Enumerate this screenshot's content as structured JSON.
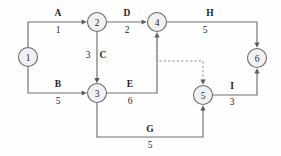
{
  "diagram": {
    "type": "directed-network-graph",
    "canvas": {
      "width": 281,
      "height": 156
    },
    "colors": {
      "node_fill": "#f1f1f1",
      "node_stroke": "#6a6a6a",
      "edge_stroke": "#6f6f6f",
      "dashed_stroke": "#8d8d8d",
      "text": "#1e1e1e",
      "background": "#fefefe"
    },
    "nodes": [
      {
        "id": "1",
        "label": "1",
        "cx": 28,
        "cy": 57,
        "r": 9.5
      },
      {
        "id": "2",
        "label": "2",
        "cx": 97,
        "cy": 22,
        "r": 9.5
      },
      {
        "id": "3",
        "label": "3",
        "cx": 97,
        "cy": 93,
        "r": 9.5
      },
      {
        "id": "4",
        "label": "4",
        "cx": 157,
        "cy": 22,
        "r": 9.5
      },
      {
        "id": "5",
        "label": "5",
        "cx": 203,
        "cy": 95,
        "r": 9.5
      },
      {
        "id": "6",
        "label": "6",
        "cx": 257,
        "cy": 58,
        "r": 9.5
      }
    ],
    "edges": [
      {
        "id": "A",
        "name": "A",
        "weight": "1",
        "from": "1",
        "to": "2",
        "name_x": 58,
        "name_y": 13,
        "weight_x": 58,
        "weight_y": 30,
        "style": "solid"
      },
      {
        "id": "B",
        "name": "B",
        "weight": "5",
        "from": "1",
        "to": "3",
        "name_x": 58,
        "name_y": 84,
        "weight_x": 58,
        "weight_y": 101,
        "style": "solid"
      },
      {
        "id": "C",
        "name": "C",
        "weight": "3",
        "from": "2",
        "to": "3",
        "name_x": 103,
        "name_y": 55,
        "weight_x": 88,
        "weight_y": 55,
        "style": "solid"
      },
      {
        "id": "D",
        "name": "D",
        "weight": "2",
        "from": "2",
        "to": "4",
        "name_x": 127,
        "name_y": 13,
        "weight_x": 127,
        "weight_y": 30,
        "style": "solid"
      },
      {
        "id": "E",
        "name": "E",
        "weight": "6",
        "from": "3",
        "to": "4",
        "name_x": 130,
        "name_y": 84,
        "weight_x": 130,
        "weight_y": 101,
        "style": "solid"
      },
      {
        "id": "G",
        "name": "G",
        "weight": "5",
        "from": "3",
        "to": "5",
        "name_x": 150,
        "name_y": 129,
        "weight_x": 150,
        "weight_y": 145,
        "style": "solid"
      },
      {
        "id": "H",
        "name": "H",
        "weight": "5",
        "from": "4",
        "to": "6",
        "name_x": 210,
        "name_y": 13,
        "weight_x": 205,
        "weight_y": 30,
        "style": "solid"
      },
      {
        "id": "I",
        "name": "I",
        "weight": "3",
        "from": "5",
        "to": "6",
        "name_x": 232,
        "name_y": 86,
        "weight_x": 232,
        "weight_y": 102,
        "style": "solid"
      },
      {
        "id": "dummy",
        "name": "",
        "weight": "",
        "from": "4",
        "to": "5",
        "name_x": 0,
        "name_y": 0,
        "weight_x": 0,
        "weight_y": 0,
        "style": "dashed"
      }
    ]
  }
}
